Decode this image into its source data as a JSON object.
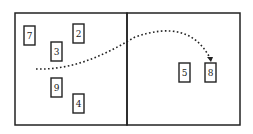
{
  "diagram": {
    "panels": [
      {
        "name": "left-panel",
        "x": 15,
        "y": 13,
        "w": 112,
        "h": 112
      },
      {
        "name": "right-panel",
        "x": 127,
        "y": 13,
        "w": 113,
        "h": 112
      }
    ],
    "boxes": [
      {
        "label": "7",
        "x": 24,
        "y": 26,
        "w": 11,
        "h": 19
      },
      {
        "label": "2",
        "x": 73,
        "y": 24,
        "w": 11,
        "h": 19
      },
      {
        "label": "3",
        "x": 51,
        "y": 42,
        "w": 11,
        "h": 19
      },
      {
        "label": "9",
        "x": 51,
        "y": 78,
        "w": 11,
        "h": 19
      },
      {
        "label": "4",
        "x": 73,
        "y": 94,
        "w": 11,
        "h": 19
      },
      {
        "label": "5",
        "x": 179,
        "y": 63,
        "w": 11,
        "h": 19
      },
      {
        "label": "8",
        "x": 205,
        "y": 63,
        "w": 11,
        "h": 19
      }
    ],
    "arrow": {
      "style": "dotted",
      "from": "left-panel",
      "to": "box-8",
      "path": "M36 69 C 70 70, 100 58, 135 37 C 170 25, 195 30, 210 58"
    },
    "colors": {
      "stroke": "#222222",
      "background": "#ffffff"
    }
  }
}
